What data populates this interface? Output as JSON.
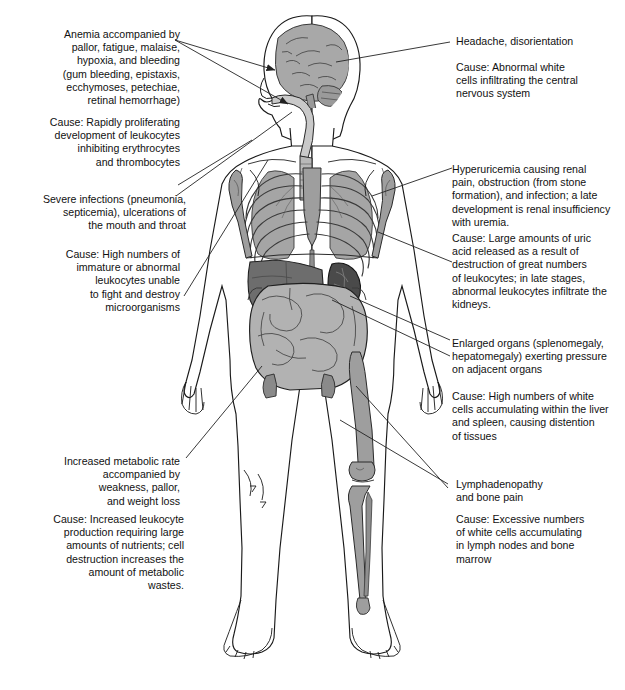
{
  "diagram": {
    "palette": {
      "outline": "#1a1a1a",
      "skin": "#ffffff",
      "bone": "#9e9e9e",
      "brain": "#a8a8a8",
      "lung": "#a5a5a5",
      "liver": "#6d6d6d",
      "spleen": "#4a4a4a",
      "intestine": "#b2b2b2",
      "leader": "#222222",
      "text": "#111111"
    }
  },
  "callouts": {
    "left": [
      {
        "id": "anemia",
        "align": "right",
        "symptom": "Anemia accompanied by\npallor, fatigue, malaise,\nhypoxia, and  bleeding\n(gum bleeding, epistaxis,\necchymoses, petechiae,\nretinal hemorrhage)",
        "cause": "Cause:  Rapidly proliferating\ndevelopment of leukocytes\ninhibiting erythrocytes\nand thrombocytes"
      },
      {
        "id": "infections",
        "align": "right",
        "symptom": "Severe infections (pneumonia,\nsepticemia), ulcerations of\nthe mouth and throat",
        "cause": "Cause:  High numbers of\nimmature or abnormal\nleukocytes  unable\nto fight and destroy\nmicroorganisms"
      },
      {
        "id": "metabolic",
        "align": "right",
        "symptom": "Increased metabolic rate\naccompanied by\nweakness, pallor,\nand weight loss",
        "cause": "Cause:  Increased leukocyte\nproduction requiring large\namounts of nutrients; cell\ndestruction increases the\namount of metabolic\nwastes."
      }
    ],
    "right": [
      {
        "id": "headache",
        "align": "left",
        "symptom": "Headache, disorientation",
        "cause": "Cause:  Abnormal white\ncells infiltrating the central\nnervous system"
      },
      {
        "id": "hyperuricemia",
        "align": "left",
        "symptom": "Hyperuricemia causing renal\npain, obstruction (from stone\nformation), and infection; a late\ndevelopment is renal insufficiency\nwith uremia.",
        "cause": "Cause:  Large amounts of uric\nacid released as a result of\ndestruction of great numbers\nof leukocytes; in late stages,\nabnormal leukocytes infiltrate the\nkidneys."
      },
      {
        "id": "organomegaly",
        "align": "left",
        "symptom": "Enlarged organs (splenomegaly,\nhepatomegaly) exerting pressure\non adjacent organs",
        "cause": "Cause:  High numbers of white\ncells accumulating within the liver\nand spleen, causing distention\nof tissues"
      },
      {
        "id": "lymphadenopathy",
        "align": "left",
        "symptom": "Lymphadenopathy\nand bone pain",
        "cause": "Cause:  Excessive numbers\nof white cells accumulating\nin lymph nodes and bone\nmarrow"
      }
    ]
  }
}
